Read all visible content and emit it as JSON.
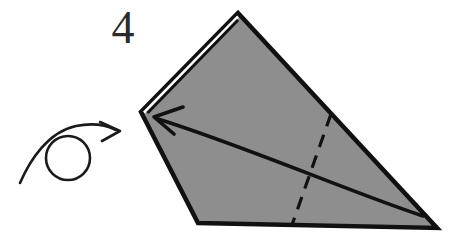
{
  "figure": {
    "kind": "origami-fold-diagram",
    "step_number": "4",
    "background_color": "#ffffff",
    "paper_fill_color": "#8e8e8e",
    "paper_stroke_color": "#111111",
    "annotation_color": "#1a1a1a",
    "canvas": {
      "width": 449,
      "height": 244
    }
  },
  "paper": {
    "label": "folded-paper-shape",
    "outline_points": "238,13 437,228 198,223 141,112",
    "vertices": [
      {
        "name": "apex-top",
        "x": 238,
        "y": 13
      },
      {
        "name": "corner-right-bottom",
        "x": 437,
        "y": 228
      },
      {
        "name": "corner-left-bottom",
        "x": 198,
        "y": 223
      },
      {
        "name": "corner-left",
        "x": 141,
        "y": 112
      }
    ],
    "folded_edge_highlight": {
      "name": "upper-left-folded-edge",
      "points": "141,112 238,13"
    }
  },
  "creases": {
    "valley_fold": {
      "label": "dashed-valley-fold-line",
      "style": "dashed",
      "from": {
        "x": 331,
        "y": 114
      },
      "to": {
        "x": 292,
        "y": 225
      },
      "dash_pattern": "13 9"
    }
  },
  "arrows": {
    "fold_arrow": {
      "label": "fold-direction-arrow",
      "description": "curved arrow sweeping from lower right toward upper left",
      "path": "M 423 216 C 350 192 250 148 158 119",
      "head_tip": {
        "x": 155,
        "y": 117
      }
    },
    "turn_over_symbol": {
      "label": "turn-over-symbol",
      "description": "circle with curved arrow looping over it indicating turn the model over",
      "circle": {
        "cx": 68,
        "cy": 158,
        "r": 22
      },
      "tail_path": "M 20 183 C 30 160 48 132 76 126 C 96 122 108 126 116 130",
      "head_tip": {
        "x": 120,
        "y": 131
      }
    }
  }
}
